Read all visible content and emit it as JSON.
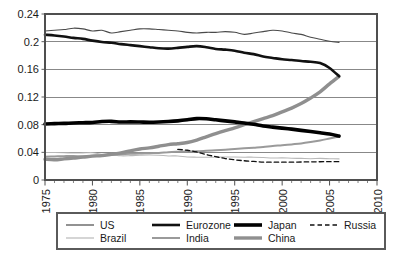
{
  "chart_data": {
    "type": "line",
    "title": "",
    "subtitle": "",
    "xlabel": "",
    "ylabel": "",
    "xlim": [
      1975,
      2010
    ],
    "ylim": [
      0,
      0.24
    ],
    "grid": true,
    "grid_axis": "y",
    "legend_position": "bottom",
    "xticks": [
      1975,
      1980,
      1985,
      1990,
      1995,
      2000,
      2005,
      2010
    ],
    "xtick_labels": [
      "1975",
      "1980",
      "1985",
      "1990",
      "1995",
      "2000",
      "2005",
      "2010"
    ],
    "xminor_tick_interval": 1,
    "yticks": [
      0,
      0.04,
      0.08,
      0.12,
      0.16,
      0.2,
      0.24
    ],
    "ytick_labels": [
      "0",
      "0.04",
      "0.08",
      "0.12",
      "0.16",
      "0.2",
      "0.24"
    ],
    "series": [
      {
        "name": "US",
        "style": "solid",
        "color": "#4a4a4a",
        "width": 1.1,
        "x": [
          1975,
          1976,
          1977,
          1978,
          1979,
          1980,
          1981,
          1982,
          1983,
          1984,
          1985,
          1986,
          1987,
          1988,
          1989,
          1990,
          1991,
          1992,
          1993,
          1994,
          1995,
          1996,
          1997,
          1998,
          1999,
          2000,
          2001,
          2002,
          2003,
          2004,
          2005,
          2006
        ],
        "values": [
          0.2155,
          0.2165,
          0.2175,
          0.2195,
          0.2185,
          0.2155,
          0.2165,
          0.2125,
          0.2145,
          0.2165,
          0.2185,
          0.2185,
          0.2175,
          0.2165,
          0.2155,
          0.2135,
          0.2125,
          0.2135,
          0.2135,
          0.2145,
          0.2135,
          0.2105,
          0.2125,
          0.2145,
          0.2165,
          0.2155,
          0.2125,
          0.2105,
          0.2065,
          0.2035,
          0.2005,
          0.199
        ]
      },
      {
        "name": "Eurozone",
        "style": "solid",
        "color": "#111111",
        "width": 2.6,
        "x": [
          1975,
          1976,
          1977,
          1978,
          1979,
          1980,
          1981,
          1982,
          1983,
          1984,
          1985,
          1986,
          1987,
          1988,
          1989,
          1990,
          1991,
          1992,
          1993,
          1994,
          1995,
          1996,
          1997,
          1998,
          1999,
          2000,
          2001,
          2002,
          2003,
          2004,
          2005,
          2006
        ],
        "values": [
          0.21,
          0.209,
          0.2075,
          0.2055,
          0.204,
          0.2015,
          0.1995,
          0.1985,
          0.1965,
          0.195,
          0.1935,
          0.192,
          0.1905,
          0.19,
          0.191,
          0.1925,
          0.1935,
          0.192,
          0.1895,
          0.1885,
          0.187,
          0.184,
          0.182,
          0.1785,
          0.1765,
          0.1745,
          0.1735,
          0.172,
          0.171,
          0.169,
          0.162,
          0.15
        ]
      },
      {
        "name": "Japan",
        "style": "solid",
        "color": "#000000",
        "width": 3.6,
        "x": [
          1975,
          1976,
          1977,
          1978,
          1979,
          1980,
          1981,
          1982,
          1983,
          1984,
          1985,
          1986,
          1987,
          1988,
          1989,
          1990,
          1991,
          1992,
          1993,
          1994,
          1995,
          1996,
          1997,
          1998,
          1999,
          2000,
          2001,
          2002,
          2003,
          2004,
          2005,
          2006
        ],
        "values": [
          0.081,
          0.0815,
          0.0818,
          0.0825,
          0.0828,
          0.0832,
          0.0845,
          0.0848,
          0.0838,
          0.084,
          0.0838,
          0.0835,
          0.0838,
          0.0845,
          0.0855,
          0.087,
          0.0888,
          0.0885,
          0.087,
          0.0855,
          0.084,
          0.0825,
          0.0805,
          0.078,
          0.0765,
          0.075,
          0.0735,
          0.0718,
          0.07,
          0.0682,
          0.0665,
          0.0635
        ]
      },
      {
        "name": "Russia",
        "style": "dashed",
        "color": "#111111",
        "width": 1.3,
        "x": [
          1989,
          1990,
          1991,
          1992,
          1993,
          1994,
          1995,
          1996,
          1997,
          1998,
          1999,
          2000,
          2001,
          2002,
          2003,
          2004,
          2005,
          2006
        ],
        "values": [
          0.0442,
          0.043,
          0.0405,
          0.0368,
          0.0338,
          0.031,
          0.0292,
          0.0278,
          0.0268,
          0.0258,
          0.0258,
          0.0258,
          0.0258,
          0.026,
          0.0262,
          0.0264,
          0.0265,
          0.0265
        ]
      },
      {
        "name": "Brazil",
        "style": "solid",
        "color": "#b9b9b9",
        "width": 1.1,
        "x": [
          1975,
          1976,
          1977,
          1978,
          1979,
          1980,
          1981,
          1982,
          1983,
          1984,
          1985,
          1986,
          1987,
          1988,
          1989,
          1990,
          1991,
          1992,
          1993,
          1994,
          1995,
          1996,
          1997,
          1998,
          1999,
          2000,
          2001,
          2002,
          2003,
          2004,
          2005,
          2006
        ],
        "values": [
          0.0398,
          0.0398,
          0.0395,
          0.039,
          0.0392,
          0.0395,
          0.0372,
          0.0365,
          0.035,
          0.0352,
          0.0358,
          0.0362,
          0.0358,
          0.0348,
          0.0348,
          0.0332,
          0.033,
          0.0328,
          0.033,
          0.0332,
          0.0332,
          0.033,
          0.033,
          0.0325,
          0.0318,
          0.032,
          0.0315,
          0.0312,
          0.0308,
          0.0312,
          0.0308,
          0.0305
        ]
      },
      {
        "name": "India",
        "style": "solid",
        "color": "#9a9a9a",
        "width": 2.0,
        "x": [
          1975,
          1976,
          1977,
          1978,
          1979,
          1980,
          1981,
          1982,
          1983,
          1984,
          1985,
          1986,
          1987,
          1988,
          1989,
          1990,
          1991,
          1992,
          1993,
          1994,
          1995,
          1996,
          1997,
          1998,
          1999,
          2000,
          2001,
          2002,
          2003,
          2004,
          2005,
          2006
        ],
        "values": [
          0.0335,
          0.034,
          0.0345,
          0.0348,
          0.0342,
          0.035,
          0.0358,
          0.0362,
          0.0372,
          0.0378,
          0.0382,
          0.0388,
          0.0392,
          0.0402,
          0.0408,
          0.0412,
          0.0415,
          0.0422,
          0.043,
          0.0438,
          0.0448,
          0.0458,
          0.0468,
          0.0478,
          0.0492,
          0.0502,
          0.0515,
          0.0528,
          0.0548,
          0.0572,
          0.06,
          0.0628
        ]
      },
      {
        "name": "China",
        "style": "solid",
        "color": "#8f8f8f",
        "width": 3.4,
        "x": [
          1975,
          1976,
          1977,
          1978,
          1979,
          1980,
          1981,
          1982,
          1983,
          1984,
          1985,
          1986,
          1987,
          1988,
          1989,
          1990,
          1991,
          1992,
          1993,
          1994,
          1995,
          1996,
          1997,
          1998,
          1999,
          2000,
          2001,
          2002,
          2003,
          2004,
          2005,
          2006
        ],
        "values": [
          0.03,
          0.0292,
          0.0305,
          0.0318,
          0.033,
          0.0345,
          0.0352,
          0.0372,
          0.0392,
          0.0422,
          0.0448,
          0.0465,
          0.0488,
          0.0512,
          0.0525,
          0.0542,
          0.0578,
          0.0625,
          0.0672,
          0.0715,
          0.0755,
          0.08,
          0.0845,
          0.0888,
          0.093,
          0.0985,
          0.104,
          0.1105,
          0.1185,
          0.1275,
          0.139,
          0.1498
        ]
      }
    ]
  },
  "legend": {
    "entries": [
      {
        "label": "US",
        "key": "US"
      },
      {
        "label": "Eurozone",
        "key": "Eurozone"
      },
      {
        "label": "Japan",
        "key": "Japan"
      },
      {
        "label": "Russia",
        "key": "Russia"
      },
      {
        "label": "Brazil",
        "key": "Brazil"
      },
      {
        "label": "India",
        "key": "India"
      },
      {
        "label": "China",
        "key": "China"
      }
    ]
  },
  "colors": {
    "background": "#ffffff",
    "axis": "#4f4f4f",
    "grid": "#6a6a6a",
    "text": "#1a1a1a",
    "legend_border": "#5a5a5a"
  }
}
